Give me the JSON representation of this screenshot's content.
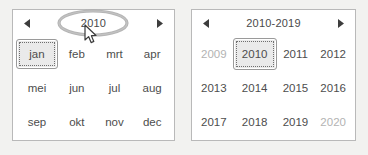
{
  "month_picker": {
    "name": "month-picker",
    "header": {
      "prev_label": "◄",
      "title": "2010",
      "next_label": "►"
    },
    "cells": [
      {
        "label": "jan",
        "state": "selected"
      },
      {
        "label": "feb",
        "state": "normal"
      },
      {
        "label": "mrt",
        "state": "normal"
      },
      {
        "label": "apr",
        "state": "normal"
      },
      {
        "label": "mei",
        "state": "normal"
      },
      {
        "label": "jun",
        "state": "normal"
      },
      {
        "label": "jul",
        "state": "normal"
      },
      {
        "label": "aug",
        "state": "normal"
      },
      {
        "label": "sep",
        "state": "normal"
      },
      {
        "label": "okt",
        "state": "normal"
      },
      {
        "label": "nov",
        "state": "normal"
      },
      {
        "label": "dec",
        "state": "normal"
      }
    ]
  },
  "year_picker": {
    "name": "year-picker",
    "header": {
      "prev_label": "◄",
      "title": "2010-2019",
      "next_label": "►"
    },
    "cells": [
      {
        "label": "2009",
        "state": "muted"
      },
      {
        "label": "2010",
        "state": "selected"
      },
      {
        "label": "2011",
        "state": "normal"
      },
      {
        "label": "2012",
        "state": "normal"
      },
      {
        "label": "2013",
        "state": "normal"
      },
      {
        "label": "2014",
        "state": "normal"
      },
      {
        "label": "2015",
        "state": "normal"
      },
      {
        "label": "2016",
        "state": "normal"
      },
      {
        "label": "2017",
        "state": "normal"
      },
      {
        "label": "2018",
        "state": "normal"
      },
      {
        "label": "2019",
        "state": "normal"
      },
      {
        "label": "2020",
        "state": "muted"
      }
    ]
  },
  "annotation": {
    "shape": "ellipse-highlight",
    "target": "2010",
    "stroke_color": "#a0a0a0"
  },
  "cursor": {
    "type": "arrow-pointer",
    "fill": "#ffffff",
    "stroke": "#3a3a3a"
  },
  "colors": {
    "page_background": "#f2f2f0",
    "panel_background": "#ffffff",
    "panel_border": "#b9b9b9",
    "text": "#4d4d4d",
    "muted_text": "#b3b3b3",
    "selected_fill": "#eaeaea",
    "selected_border": "#9a9a9a"
  }
}
